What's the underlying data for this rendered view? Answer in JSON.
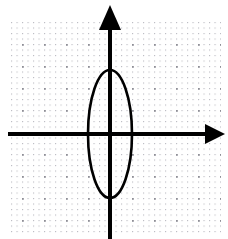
{
  "figure": {
    "title": "",
    "background_color": "#ffffff",
    "width": 228,
    "height": 239
  },
  "chart_data": {
    "type": "scatter",
    "title": "",
    "subtitle": "",
    "xlabel": "",
    "ylabel": "",
    "grid": true,
    "grid_style": "dotted",
    "legend": "none",
    "axis_color": "#000000",
    "grid_color": "#b9b9bf",
    "grid_major_color": "#8e8e96",
    "curve_color": "#000000",
    "xlim": [
      -4.6,
      5.2
    ],
    "ylim": [
      -4.8,
      5.1
    ],
    "xticks": [
      -4,
      -3,
      -2,
      -1,
      0,
      1,
      2,
      3,
      4,
      5
    ],
    "yticks": [
      -4,
      -3,
      -2,
      -1,
      0,
      1,
      2,
      3,
      4,
      5
    ],
    "tick_labels_visible": false,
    "grid_unit_px": 22,
    "origin_px": {
      "x": 110,
      "y": 134
    },
    "x_axis": {
      "label": "x-axis",
      "y_px": 134,
      "start_px": 8,
      "end_px": 225,
      "arrow_start": false,
      "arrow_end": true,
      "thickness_px": 4
    },
    "y_axis": {
      "label": "y-axis",
      "x_px": 110,
      "start_px": 5,
      "end_px": 239,
      "arrow_start": true,
      "arrow_end": false,
      "thickness_px": 4
    },
    "series": [
      {
        "name": "ellipse",
        "type": "ellipse",
        "center": [
          0,
          0
        ],
        "center_px": [
          110,
          134
        ],
        "semi_axis_x": 1,
        "semi_axis_y": 3,
        "semi_axis_x_px": 22,
        "semi_axis_y_px": 64,
        "rotation_deg": 0,
        "stroke_width_px": 2.6,
        "fill": "none",
        "vertices": [
          [
            0,
            3
          ],
          [
            0,
            -3
          ]
        ],
        "co_vertices": [
          [
            -1,
            0
          ],
          [
            1,
            0
          ]
        ],
        "x_intercepts": [
          [
            -1,
            0
          ],
          [
            1,
            0
          ]
        ],
        "y_intercepts": [
          [
            0,
            3
          ],
          [
            0,
            -3
          ]
        ],
        "equation": "x^2/1 + y^2/9 = 1"
      }
    ]
  }
}
